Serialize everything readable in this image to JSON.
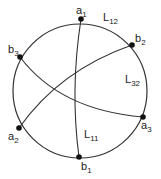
{
  "diagram": {
    "circle": {
      "cx": 80,
      "cy": 91,
      "r": 67
    },
    "points": [
      {
        "id": "a1",
        "base": "a",
        "sub": "1",
        "x": 81,
        "y": 19,
        "lx": 76,
        "ly": 14
      },
      {
        "id": "b2",
        "base": "b",
        "sub": "2",
        "x": 132,
        "y": 45,
        "lx": 135,
        "ly": 42
      },
      {
        "id": "a3",
        "base": "a",
        "sub": "3",
        "x": 143,
        "y": 117,
        "lx": 141,
        "ly": 129
      },
      {
        "id": "b1",
        "base": "b",
        "sub": "1",
        "x": 79,
        "y": 157,
        "lx": 81,
        "ly": 170
      },
      {
        "id": "a2",
        "base": "a",
        "sub": "2",
        "x": 19,
        "y": 128,
        "lx": 8,
        "ly": 140
      },
      {
        "id": "b3",
        "base": "b",
        "sub": "3",
        "x": 20,
        "y": 57,
        "lx": 8,
        "ly": 53
      }
    ],
    "curves": [
      {
        "id": "a1-b1",
        "d": "M81,19 Q70,90 79,157"
      },
      {
        "id": "b2-a2",
        "d": "M132,45 Q60,70 19,128"
      },
      {
        "id": "b3-a3",
        "d": "M20,57 Q60,110 143,117"
      }
    ],
    "labels": [
      {
        "id": "L12",
        "base": "L",
        "sub": "12",
        "x": 103,
        "y": 21
      },
      {
        "id": "L32",
        "base": "L",
        "sub": "32",
        "x": 125,
        "y": 83
      },
      {
        "id": "L11",
        "base": "L",
        "sub": "11",
        "x": 84,
        "y": 138
      }
    ]
  }
}
